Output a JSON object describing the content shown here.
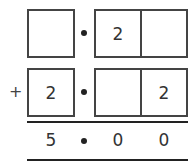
{
  "problem": {
    "row1": {
      "cells": [
        "",
        "2",
        ""
      ]
    },
    "row2": {
      "operator": "+",
      "cells": [
        "2",
        "",
        "2"
      ]
    },
    "result": {
      "digits": [
        "5",
        "0",
        "0"
      ]
    }
  }
}
